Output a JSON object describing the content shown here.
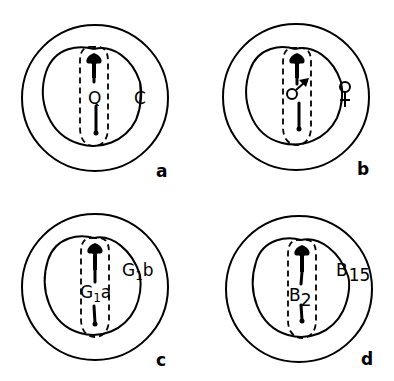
{
  "figure": {
    "panels": [
      {
        "id": "a",
        "panel_letter": "a",
        "center_label": "Q",
        "side_label": "C"
      },
      {
        "id": "b",
        "panel_letter": "b",
        "center_label": "male-symbol",
        "center_glyph": "♂",
        "side_label": "female-symbol",
        "side_glyph": "♀"
      },
      {
        "id": "c",
        "panel_letter": "c",
        "center_label": {
          "main": "G",
          "sub": "1",
          "suffix": "a"
        },
        "side_label": {
          "main": "G",
          "sub": "1",
          "suffix": "b"
        }
      },
      {
        "id": "d",
        "panel_letter": "d",
        "center_label": {
          "main": "B",
          "sub": "2"
        },
        "side_label": {
          "main": "B",
          "sub": "15"
        }
      }
    ],
    "colors": {
      "stroke": "#000000",
      "background": "#ffffff"
    }
  }
}
